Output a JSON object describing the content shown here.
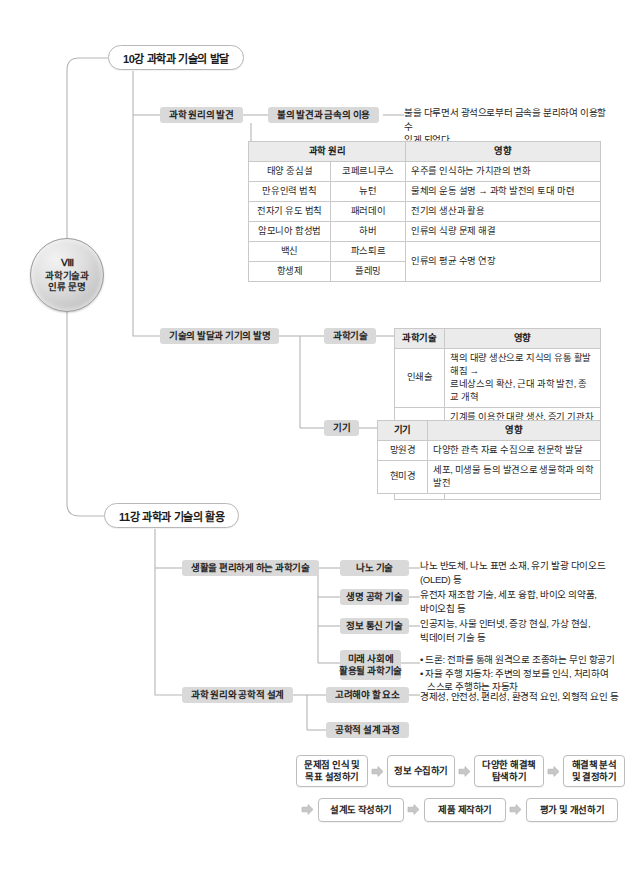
{
  "root": {
    "roman": "Ⅷ",
    "line1": "과학기술과",
    "line2": "인류 문명"
  },
  "chapters": [
    {
      "id": "ch10",
      "label": "10강 과학과 기술의 발달"
    },
    {
      "id": "ch11",
      "label": "11강 과학과 기술의 활용"
    }
  ],
  "branches": {
    "discovery": "과학 원리의 발견",
    "fire": "불의 발견과 금속의 이용",
    "fire_desc": "불을 다루면서 광석으로부터 금속을 분리하여 이용할 수\n있게 되었다.",
    "tech_dev": "기술의 발달과 기기의 발명",
    "sci_tech": "과학기술",
    "devices": "기기",
    "convenient": "생활을 편리하게 하는 과학기술",
    "nano": "나노 기술",
    "nano_desc": "나노 반도체, 나노 표면 소재, 유기 발광 다이오드\n(OLED) 등",
    "bio": "생명 공학 기술",
    "bio_desc": "유전자 재조합 기술, 세포 융합, 바이오 의약품,\n바이오칩 등",
    "ict": "정보 통신 기술",
    "ict_desc": "인공지능, 사물 인터넷, 증강 현실, 가상 현실,\n빅데이터 기술 등",
    "future_l1": "미래 사회에",
    "future_l2": "활용될 과학기술",
    "future_b1": "• 드론: 전파를 통해 원격으로 조종하는 무인 항공기",
    "future_b2": "• 자율 주행 자동차: 주변의 정보를 인식, 처리하여",
    "future_b2b": "  스스로 주행하는 자동차",
    "principles": "과학 원리와 공학적 설계",
    "factors": "고려해야 할 요소",
    "factors_desc": "경제성, 안전성, 편리성, 환경적 요인, 외형적 요인 등",
    "design_process": "공학적 설계 과정"
  },
  "table_principles": {
    "headers": [
      "과학 원리",
      "영향"
    ],
    "rows": [
      {
        "name": "태양 중심설",
        "person": "코페르니쿠스",
        "effect": "우주를 인식하는 가치관의 변화",
        "rowspan": 1
      },
      {
        "name": "만유인력 법칙",
        "person": "뉴턴",
        "effect": "물체의 운동 설명 → 과학 발전의 토대 마련",
        "rowspan": 1
      },
      {
        "name": "전자기 유도 법칙",
        "person": "패러데이",
        "effect": "전기의 생산과 활용",
        "rowspan": 1
      },
      {
        "name": "암모니아 합성법",
        "person": "하버",
        "effect": "인류의 식량 문제 해결",
        "rowspan": 1
      },
      {
        "name": "백신",
        "person": "파스퇴르",
        "effect": "인류의 평균 수명 연장",
        "rowspan": 2
      },
      {
        "name": "항생제",
        "person": "플레밍",
        "effect": "",
        "rowspan": 0
      }
    ]
  },
  "table_sci_tech": {
    "headers": [
      "과학기술",
      "영향"
    ],
    "rows": [
      {
        "name": "인쇄술",
        "effect": "책의 대량 생산으로 지식의 유통 활발해짐 →\n르네상스의 확산, 근대 과학 발전, 종교 개혁"
      },
      {
        "name": "증기 기관",
        "effect": "기계를 이용한 대량 생산, 증기 기관차와 증기선\n개발 → 산업 혁명"
      },
      {
        "name": "통신 기술",
        "effect": "멀리 떨어진 곳과 의사소통이 가능해짐, 정보를\n쉽고 빠르게 교환"
      }
    ]
  },
  "table_devices": {
    "headers": [
      "기기",
      "영향"
    ],
    "rows": [
      {
        "name": "망원경",
        "effect": "다양한 관측 자료 수집으로 천문학 발달"
      },
      {
        "name": "현미경",
        "effect": "세포, 미생물 등의 발견으로 생물학과 의학 발전"
      }
    ]
  },
  "flow": {
    "row1": [
      {
        "l1": "문제점 인식 및",
        "l2": "목표 설정하기"
      },
      {
        "l1": "정보 수집하기",
        "l2": ""
      },
      {
        "l1": "다양한 해결책",
        "l2": "탐색하기"
      },
      {
        "l1": "해결책 분석",
        "l2": "및 결정하기"
      }
    ],
    "row2": [
      {
        "l1": "설계도 작성하기",
        "l2": ""
      },
      {
        "l1": "제품 제작하기",
        "l2": ""
      },
      {
        "l1": "평가 및 개선하기",
        "l2": ""
      }
    ]
  },
  "colors": {
    "line": "#b5b5b5",
    "tag_bg": "#d9d9d9",
    "table_header": "#ebebeb",
    "border": "#c9c9c9"
  }
}
